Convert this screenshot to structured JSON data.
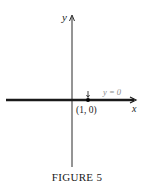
{
  "figure": {
    "caption": "FIGURE 5",
    "x_axis_label": "x",
    "y_axis_label": "y",
    "line_label": "y = 0",
    "point_label": "(1, 0)",
    "point": {
      "x": 1,
      "y": 0
    },
    "colors": {
      "axes": "#2a2a2a",
      "line": "#1a1a1a",
      "line_label": "#8a8a8a"
    }
  }
}
